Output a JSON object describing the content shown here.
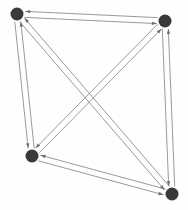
{
  "figure": {
    "kind": "directed-graph",
    "title": "",
    "width": 188,
    "height": 210,
    "background_color": "#fefefe"
  },
  "style": {
    "node_fill": "#3a3a3a",
    "node_radius": 6.5,
    "edge_color": "#8f8f8f",
    "edge_width": 0.9,
    "arrowhead_color": "#6e6e6e",
    "arrowhead_length": 5,
    "arrowhead_width": 3.4,
    "pair_offset": 3.0
  },
  "graph": {
    "directed": true,
    "node_count": 4,
    "edge_count": 12,
    "nodes": [
      {
        "id": "n1",
        "label": "",
        "x": 17,
        "y": 14,
        "position": "top-left"
      },
      {
        "id": "n2",
        "label": "",
        "x": 165,
        "y": 21,
        "position": "top-right"
      },
      {
        "id": "n3",
        "label": "",
        "x": 32,
        "y": 156,
        "position": "bottom-left"
      },
      {
        "id": "n4",
        "label": "",
        "x": 172,
        "y": 194,
        "position": "bottom-right"
      }
    ],
    "edges": [
      {
        "from": "n1",
        "to": "n2",
        "kind": "top-side"
      },
      {
        "from": "n2",
        "to": "n1",
        "kind": "top-side"
      },
      {
        "from": "n1",
        "to": "n3",
        "kind": "left-side"
      },
      {
        "from": "n3",
        "to": "n1",
        "kind": "left-side"
      },
      {
        "from": "n2",
        "to": "n4",
        "kind": "right-side"
      },
      {
        "from": "n4",
        "to": "n2",
        "kind": "right-side"
      },
      {
        "from": "n3",
        "to": "n4",
        "kind": "bottom-side"
      },
      {
        "from": "n4",
        "to": "n3",
        "kind": "bottom-side"
      },
      {
        "from": "n1",
        "to": "n4",
        "kind": "diagonal"
      },
      {
        "from": "n4",
        "to": "n1",
        "kind": "diagonal"
      },
      {
        "from": "n2",
        "to": "n3",
        "kind": "diagonal"
      },
      {
        "from": "n3",
        "to": "n2",
        "kind": "diagonal"
      }
    ]
  }
}
